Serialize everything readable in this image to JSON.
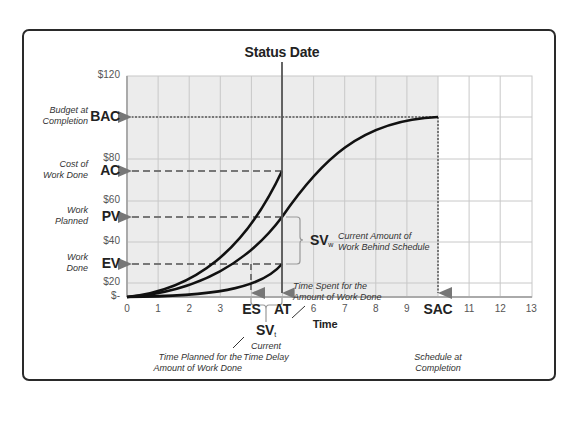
{
  "title": "Status Date",
  "colors": {
    "plot_bg": "#ececec",
    "plot_bg_right": "#ffffff",
    "grid": "#c8c8c8",
    "curve": "#111111",
    "guide": "#777777",
    "status_line": "#555555",
    "frame": "#2a2a2a"
  },
  "y_axis": {
    "ticks": [
      {
        "label": "$120",
        "y": 76
      },
      {
        "label": "$80",
        "y": 159
      },
      {
        "label": "$60",
        "y": 201
      },
      {
        "label": "$40",
        "y": 242
      },
      {
        "label": "$20",
        "y": 283
      },
      {
        "label": "$-",
        "y": 297
      }
    ],
    "markers": [
      {
        "abbr": "BAC",
        "desc_line1": "Budget at",
        "desc_line2": "Completion",
        "y": 117
      },
      {
        "abbr": "AC",
        "desc_line1": "Cost of",
        "desc_line2": "Work Done",
        "y": 171
      },
      {
        "abbr": "PV",
        "desc_line1": "Work",
        "desc_line2": "Planned",
        "y": 217
      },
      {
        "abbr": "EV",
        "desc_line1": "Work",
        "desc_line2": "Done",
        "y": 264
      }
    ]
  },
  "x_axis": {
    "label": "Time",
    "ticks": [
      "0",
      "1",
      "2",
      "3",
      "ES",
      "AT",
      "6",
      "7",
      "8",
      "9",
      "SAC",
      "11",
      "12",
      "13"
    ],
    "bold_ticks": [
      "ES",
      "AT",
      "SAC"
    ]
  },
  "annotations": {
    "svw_abbr": "SV",
    "svw_sub": "w",
    "svw_desc_line1": "Current Amount of",
    "svw_desc_line2": "Work Behind Schedule",
    "svt_abbr": "SV",
    "svt_sub": "t",
    "svt_desc_line1": "Current",
    "svt_desc_line2": "Time Delay",
    "at_desc_line1": "Time Spent for the",
    "at_desc_line2": "Amount of Work Done",
    "es_desc_line1": "Time Planned for the",
    "es_desc_line2": "Amount of Work Done",
    "sac_desc_line1": "Schedule at",
    "sac_desc_line2": "Completion"
  },
  "chart_data": {
    "type": "line",
    "title": "Status Date",
    "xlabel": "Time",
    "ylabel": "",
    "x_ticks": [
      "0",
      "1",
      "2",
      "3",
      "ES",
      "AT",
      "6",
      "7",
      "8",
      "9",
      "SAC",
      "11",
      "12",
      "13"
    ],
    "y_ticks": [
      "$-",
      "$20",
      "$40",
      "$60",
      "$80",
      "$120"
    ],
    "xlim": [
      0,
      13
    ],
    "ylim": [
      0,
      120
    ],
    "status_date_x": 5,
    "series": [
      {
        "name": "PV (Planned Value)",
        "x": [
          0,
          1,
          2,
          3,
          4,
          5,
          6,
          7,
          8,
          9,
          10
        ],
        "values": [
          0,
          2,
          6,
          14,
          28,
          52,
          72,
          86,
          94,
          99,
          100
        ]
      },
      {
        "name": "AC (Actual Cost)",
        "x": [
          0,
          1,
          2,
          3,
          4,
          5
        ],
        "values": [
          0,
          3,
          9,
          20,
          40,
          72
        ]
      },
      {
        "name": "EV (Earned Value)",
        "x": [
          0,
          1,
          2,
          3,
          4,
          5
        ],
        "values": [
          0,
          1,
          3,
          7,
          14,
          28
        ]
      }
    ],
    "reference_levels": {
      "BAC": 100,
      "AC": 72,
      "PV": 52,
      "EV": 28
    },
    "reference_times": {
      "ES": 4,
      "AT": 5,
      "SAC": 10
    },
    "grid": true
  }
}
